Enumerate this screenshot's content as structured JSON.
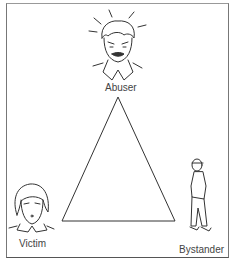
{
  "diagram": {
    "type": "triangle-relationship",
    "nodes": [
      {
        "id": "abuser",
        "label": "Abuser",
        "position": "top"
      },
      {
        "id": "victim",
        "label": "Victim",
        "position": "bottom-left"
      },
      {
        "id": "bystander",
        "label": "Bystander",
        "position": "bottom-right"
      }
    ],
    "stroke_color": "#333333",
    "frame_color": "#777777"
  }
}
